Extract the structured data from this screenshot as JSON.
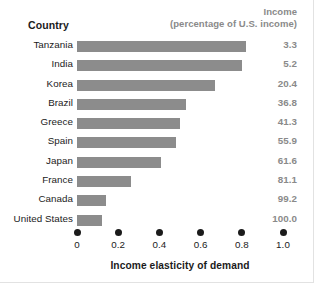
{
  "header": {
    "country_label": "Country",
    "income_line1": "Income",
    "income_line2": "(percentage of U.S. income)"
  },
  "axis": {
    "title": "Income elasticity of demand",
    "ticks": [
      "0",
      "0.2",
      "0.4",
      "0.6",
      "0.8",
      "1.0"
    ]
  },
  "rows": [
    {
      "country": "Tanzania",
      "elasticity": 0.82,
      "income": "3.3"
    },
    {
      "country": "India",
      "elasticity": 0.8,
      "income": "5.2"
    },
    {
      "country": "Korea",
      "elasticity": 0.67,
      "income": "20.4"
    },
    {
      "country": "Brazil",
      "elasticity": 0.53,
      "income": "36.8"
    },
    {
      "country": "Greece",
      "elasticity": 0.5,
      "income": "41.3"
    },
    {
      "country": "Spain",
      "elasticity": 0.48,
      "income": "55.9"
    },
    {
      "country": "Japan",
      "elasticity": 0.41,
      "income": "61.6"
    },
    {
      "country": "France",
      "elasticity": 0.26,
      "income": "81.1"
    },
    {
      "country": "Canada",
      "elasticity": 0.14,
      "income": "99.2"
    },
    {
      "country": "United States",
      "elasticity": 0.12,
      "income": "100.0"
    }
  ],
  "colors": {
    "bar": "#8c8c8c",
    "text": "#1b1b1b",
    "muted": "#8a8a8a",
    "background": "#ffffff"
  },
  "chart_data": {
    "type": "bar",
    "orientation": "horizontal",
    "title": "",
    "xlabel": "Income elasticity of demand",
    "ylabel": "Country",
    "xlim": [
      0,
      1.0
    ],
    "xticks": [
      0,
      0.2,
      0.4,
      0.6,
      0.8,
      1.0
    ],
    "grid": false,
    "legend": "none",
    "categories": [
      "Tanzania",
      "India",
      "Korea",
      "Brazil",
      "Greece",
      "Spain",
      "Japan",
      "France",
      "Canada",
      "United States"
    ],
    "values": [
      0.82,
      0.8,
      0.67,
      0.53,
      0.5,
      0.48,
      0.41,
      0.26,
      0.14,
      0.12
    ],
    "annotations": {
      "column_header": "Income (percentage of U.S. income)",
      "values": [
        "3.3",
        "5.2",
        "20.4",
        "36.8",
        "41.3",
        "55.9",
        "61.6",
        "81.1",
        "99.2",
        "100.0"
      ]
    },
    "series": [
      {
        "name": "Income elasticity of demand",
        "values": [
          0.82,
          0.8,
          0.67,
          0.53,
          0.5,
          0.48,
          0.41,
          0.26,
          0.14,
          0.12
        ]
      }
    ]
  }
}
